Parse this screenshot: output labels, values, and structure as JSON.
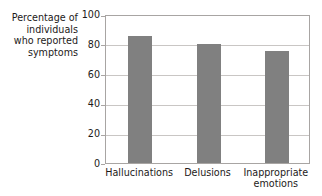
{
  "chart_data": {
    "type": "bar",
    "title": "",
    "xlabel": "",
    "ylabel": "Percentage of individuals who reported symptoms",
    "ylabel_lines": [
      "Percentage of",
      "individuals",
      "who reported",
      "symptoms"
    ],
    "categories": [
      "Hallucinations",
      "Delusions",
      "Inappropriate emotions"
    ],
    "category_lines": [
      [
        "Hallucinations"
      ],
      [
        "Delusions"
      ],
      [
        "Inappropriate",
        "emotions"
      ]
    ],
    "values": [
      85,
      80,
      75
    ],
    "ylim": [
      0,
      100
    ],
    "yticks": [
      100,
      80,
      60,
      40,
      20,
      0
    ],
    "ytick_labels": [
      "100",
      "80",
      "60",
      "40",
      "20",
      "0"
    ],
    "grid": true,
    "grid_axis": "y",
    "legend": null,
    "bar_color": "#808080",
    "axis_color": "#a8a5a3",
    "grid_color": "#c9c6c4",
    "text_color": "#1d1a19",
    "background": "#ffffff"
  },
  "artifact": {
    "top_cropped_text": ""
  }
}
